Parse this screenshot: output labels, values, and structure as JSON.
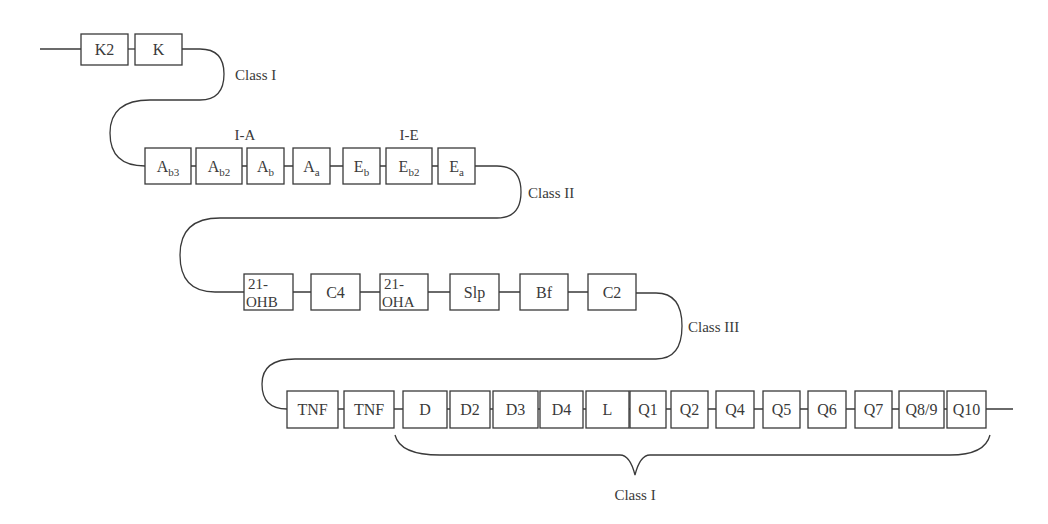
{
  "diagram": {
    "type": "gene-map",
    "colors": {
      "stroke": "#3a3a3a",
      "background": "#ffffff",
      "text": "#3a3a3a"
    },
    "rows": [
      {
        "region": "Class I",
        "genes": [
          {
            "label": "K2"
          },
          {
            "label": "K"
          }
        ]
      },
      {
        "region": "Class II",
        "groups": [
          {
            "label": "I-A"
          },
          {
            "label": "I-E"
          }
        ],
        "genes": [
          {
            "base": "A",
            "sub": "b3"
          },
          {
            "base": "A",
            "sub": "b2"
          },
          {
            "base": "A",
            "sub": "b"
          },
          {
            "base": "A",
            "sub": "a"
          },
          {
            "base": "E",
            "sub": "b"
          },
          {
            "base": "E",
            "sub": "b2"
          },
          {
            "base": "E",
            "sub": "a"
          }
        ]
      },
      {
        "region": "Class III",
        "genes": [
          {
            "line1": "21-",
            "line2": "OHB"
          },
          {
            "label": "C4"
          },
          {
            "line1": "21-",
            "line2": "OHA"
          },
          {
            "label": "Slp"
          },
          {
            "label": "Bf"
          },
          {
            "label": "C2"
          }
        ]
      },
      {
        "region": "Class I",
        "genes": [
          {
            "label": "TNF"
          },
          {
            "label": "TNF"
          },
          {
            "label": "D"
          },
          {
            "label": "D2"
          },
          {
            "label": "D3"
          },
          {
            "label": "D4"
          },
          {
            "label": "L"
          },
          {
            "label": "Q1"
          },
          {
            "label": "Q2"
          },
          {
            "label": "Q4"
          },
          {
            "label": "Q5"
          },
          {
            "label": "Q6"
          },
          {
            "label": "Q7"
          },
          {
            "label": "Q8/9"
          },
          {
            "label": "Q10"
          }
        ]
      }
    ],
    "region_labels": {
      "row1": "Class I",
      "row2": "Class II",
      "row3": "Class III",
      "brace": "Class I"
    }
  }
}
